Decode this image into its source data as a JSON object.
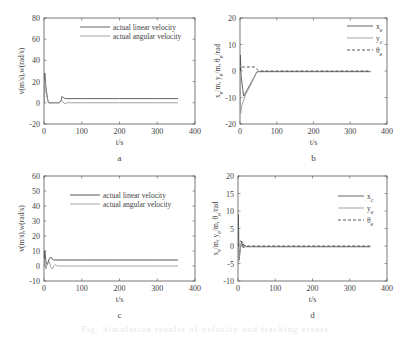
{
  "figure": {
    "caption": "Fig. Simulation results of velocity and tracking errors"
  },
  "chart_data": [
    {
      "id": "a",
      "type": "line",
      "panel_label": "a",
      "title": "",
      "xlabel": "t/s",
      "ylabel": "v(m/s),w(rad/s)",
      "xlim": [
        0,
        400
      ],
      "ylim": [
        -20,
        80
      ],
      "xticks": [
        0,
        100,
        200,
        300,
        400
      ],
      "yticks": [
        -20,
        0,
        20,
        40,
        60,
        80
      ],
      "grid": false,
      "legend_position": "upper right",
      "frame": {
        "x": 44,
        "y": 18,
        "w": 151,
        "h": 106
      },
      "legend": {
        "x": 80,
        "y": 27
      },
      "series": [
        {
          "name": "actual linear velocity",
          "color": "#555555",
          "dash": "",
          "x": [
            0,
            2,
            5,
            10,
            13,
            40,
            45,
            48,
            52,
            56,
            60,
            100,
            200,
            300,
            355
          ],
          "y": [
            0,
            28,
            15,
            2,
            0,
            0,
            2,
            6,
            4.5,
            4,
            4,
            4,
            4,
            4,
            4
          ]
        },
        {
          "name": "actual angular velocity",
          "color": "#999999",
          "dash": "",
          "x": [
            0,
            2,
            6,
            12,
            40,
            46,
            50,
            55,
            60,
            100,
            200,
            300,
            355
          ],
          "y": [
            0,
            22,
            8,
            0,
            0,
            3,
            1,
            -1,
            0,
            0,
            0,
            0,
            0
          ]
        }
      ]
    },
    {
      "id": "b",
      "type": "line",
      "panel_label": "b",
      "title": "",
      "xlabel": "t/s",
      "ylabel": "x_e/m, y_e/m, θ_e/rad",
      "xlim": [
        0,
        400
      ],
      "ylim": [
        -20,
        20
      ],
      "xticks": [
        0,
        100,
        200,
        300,
        400
      ],
      "yticks": [
        -20,
        -10,
        0,
        10,
        20
      ],
      "grid": false,
      "legend_position": "upper right",
      "frame": {
        "x": 240,
        "y": 18,
        "w": 147,
        "h": 106
      },
      "legend": {
        "x": 347,
        "y": 26
      },
      "series": [
        {
          "name": "x_e",
          "sub": "e",
          "color": "#555555",
          "dash": "",
          "x": [
            0,
            1,
            3,
            10,
            20,
            30,
            40,
            45,
            50,
            100,
            200,
            300,
            355
          ],
          "y": [
            0,
            6,
            -2,
            -9.5,
            -7,
            -4.5,
            -2,
            -0.5,
            -0.2,
            -0.2,
            -0.2,
            -0.2,
            -0.2
          ]
        },
        {
          "name": "y_c",
          "sub": "c",
          "color": "#999999",
          "dash": "",
          "x": [
            0,
            2,
            5,
            15,
            30,
            45,
            50,
            100,
            200,
            300,
            355
          ],
          "y": [
            0,
            -16,
            -13,
            -9,
            -5,
            -0.5,
            -0.3,
            -0.3,
            -0.3,
            -0.3,
            -0.3
          ]
        },
        {
          "name": "θ_e",
          "sub": "e",
          "color": "#444444",
          "dash": "3,2",
          "x": [
            0,
            3,
            10,
            40,
            50,
            55,
            100,
            200,
            300,
            355
          ],
          "y": [
            0,
            1.5,
            1.5,
            1.5,
            0.2,
            0,
            0,
            0,
            0,
            0
          ]
        }
      ]
    },
    {
      "id": "c",
      "type": "line",
      "panel_label": "c",
      "title": "",
      "xlabel": "t/s",
      "ylabel": "v(m/s),w(rad/s)",
      "xlim": [
        0,
        400
      ],
      "ylim": [
        -10,
        60
      ],
      "xticks": [
        0,
        100,
        200,
        300,
        400
      ],
      "yticks": [
        -10,
        0,
        10,
        20,
        30,
        40,
        50,
        60
      ],
      "grid": false,
      "legend_position": "upper right",
      "frame": {
        "x": 44,
        "y": 176,
        "w": 151,
        "h": 105
      },
      "legend": {
        "x": 70,
        "y": 195
      },
      "series": [
        {
          "name": "actual linear velocity",
          "color": "#444444",
          "dash": "",
          "x": [
            0,
            2,
            5,
            9,
            14,
            18,
            22,
            26,
            30,
            100,
            200,
            300,
            355
          ],
          "y": [
            0,
            10,
            3,
            1,
            5,
            6,
            4.5,
            4,
            4,
            4,
            4,
            4,
            4
          ]
        },
        {
          "name": "actual angular velocity",
          "color": "#999999",
          "dash": "",
          "x": [
            0,
            2,
            5,
            9,
            14,
            18,
            22,
            26,
            30,
            35,
            100,
            200,
            300,
            355
          ],
          "y": [
            0,
            5,
            -2,
            2,
            3,
            -1,
            -2,
            0,
            1,
            0,
            0,
            0,
            0,
            0
          ]
        }
      ]
    },
    {
      "id": "d",
      "type": "line",
      "panel_label": "d",
      "title": "",
      "xlabel": "t/s",
      "ylabel": "x_e/m, y_e/m, θ_e/rad",
      "xlim": [
        0,
        400
      ],
      "ylim": [
        -10,
        20
      ],
      "xticks": [
        0,
        100,
        200,
        300,
        400
      ],
      "yticks": [
        -10,
        -5,
        0,
        5,
        10,
        15,
        20
      ],
      "grid": false,
      "legend_position": "upper right",
      "frame": {
        "x": 238,
        "y": 176,
        "w": 149,
        "h": 105
      },
      "legend": {
        "x": 338,
        "y": 196
      },
      "series": [
        {
          "name": "x_c",
          "sub": "c",
          "color": "#555555",
          "dash": "",
          "x": [
            0,
            1,
            3,
            6,
            10,
            14,
            18,
            22,
            30,
            100,
            200,
            300,
            355
          ],
          "y": [
            0,
            9,
            -4,
            -1,
            1,
            -0.5,
            0.3,
            -0.2,
            -0.2,
            -0.2,
            -0.2,
            -0.2,
            -0.2
          ]
        },
        {
          "name": "y_e",
          "sub": "e",
          "color": "#999999",
          "dash": "",
          "x": [
            0,
            2,
            4,
            8,
            12,
            16,
            20,
            25,
            100,
            200,
            300,
            355
          ],
          "y": [
            0,
            -4.5,
            -3,
            1,
            1.2,
            -0.5,
            -0.2,
            -0.2,
            -0.2,
            -0.2,
            -0.2,
            -0.2
          ]
        },
        {
          "name": "θ_e",
          "sub": "e",
          "color": "#444444",
          "dash": "3,2",
          "x": [
            0,
            3,
            8,
            15,
            20,
            100,
            200,
            300,
            355
          ],
          "y": [
            0,
            1,
            1.5,
            0.3,
            0,
            0,
            0,
            0,
            0
          ]
        }
      ]
    }
  ]
}
